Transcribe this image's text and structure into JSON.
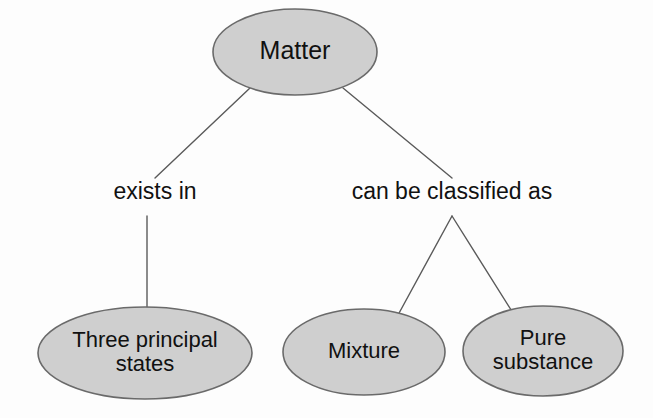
{
  "diagram": {
    "background_color": "#fdfdfd",
    "node_fill_color": "#cfcfcf",
    "node_stroke_color": "#6a6a6a",
    "text_color": "#111111",
    "line_color": "#5a5a5a",
    "nodes": [
      {
        "id": "matter",
        "label": "Matter",
        "lines": [
          "Matter"
        ],
        "cx": 295,
        "cy": 52,
        "rx": 82,
        "ry": 43,
        "font_size": 25
      },
      {
        "id": "three-principal-states",
        "label": "Three principal states",
        "lines": [
          "Three principal",
          "states"
        ],
        "cx": 145,
        "cy": 353,
        "rx": 107,
        "ry": 46,
        "font_size": 22
      },
      {
        "id": "mixture",
        "label": "Mixture",
        "lines": [
          "Mixture"
        ],
        "cx": 364,
        "cy": 352,
        "rx": 81,
        "ry": 43,
        "font_size": 22
      },
      {
        "id": "pure-substance",
        "label": "Pure substance",
        "lines": [
          "Pure",
          "substance"
        ],
        "cx": 543,
        "cy": 351,
        "rx": 80,
        "ry": 45,
        "font_size": 22
      }
    ],
    "edge_labels": [
      {
        "id": "exists-in",
        "text": "exists in",
        "x": 155,
        "y": 199,
        "font_size": 23
      },
      {
        "id": "can-be-classified-as",
        "text": "can be classified as",
        "x": 452,
        "y": 199,
        "font_size": 23
      }
    ],
    "connectors": [
      {
        "id": "matter-to-exists-in",
        "points": "250,88 155,178"
      },
      {
        "id": "matter-to-can-be-classified-as",
        "points": "343,88 452,178"
      },
      {
        "id": "exists-in-to-three-principal-states",
        "points": "147,216 147,310"
      },
      {
        "id": "classified-to-mixture",
        "points": "452,216 398,315"
      },
      {
        "id": "classified-to-pure-substance",
        "points": "452,216 513,313"
      }
    ]
  }
}
